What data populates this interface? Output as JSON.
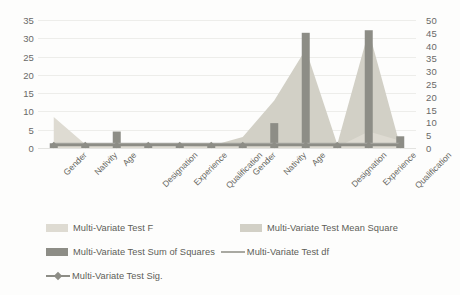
{
  "chart_data": {
    "type": "bar",
    "title": "",
    "subtitle": "",
    "xlabel": "",
    "ylabel": "",
    "ylim": [
      0,
      35
    ],
    "y2lim": [
      0,
      50
    ],
    "grid": true,
    "legend_position": "bottom",
    "categories": [
      "Gender",
      "Nativity",
      "Age",
      "Designation",
      "Experience",
      "Qualification",
      "Gender",
      "Nativity",
      "Age",
      "Designation",
      "Experience",
      "Qualification"
    ],
    "left_axis_ticks": [
      "0",
      "5",
      "10",
      "15",
      "20",
      "25",
      "30",
      "35"
    ],
    "right_axis_ticks": [
      "0",
      "5",
      "10",
      "15",
      "20",
      "25",
      "30",
      "35",
      "40",
      "45",
      "50"
    ],
    "series": [
      {
        "name": "Multi-Variate Test F",
        "type": "area",
        "color": "#dedbd2",
        "axis": "left",
        "values": [
          8.5,
          1.0,
          0.6,
          0.4,
          0.4,
          0.5,
          0.8,
          1.2,
          1.5,
          0.3,
          4.5,
          2.0
        ]
      },
      {
        "name": "Multi-Variate Test Mean Square",
        "type": "area",
        "color": "#d2d0c6",
        "axis": "left",
        "values": [
          1.2,
          0.5,
          0.5,
          0.4,
          0.4,
          0.6,
          3.0,
          13.0,
          27.0,
          1.0,
          32.0,
          0.5
        ]
      },
      {
        "name": "Multi-Variate Test Sum of Squares",
        "type": "bar",
        "color": "#8d8d86",
        "axis": "left",
        "values": [
          1.3,
          0.9,
          4.5,
          0.8,
          0.8,
          0.9,
          1.2,
          6.8,
          31.5,
          0.8,
          32.2,
          3.2
        ]
      },
      {
        "name": "Multi-Variate Test df",
        "type": "line",
        "color": "#a9a9a2",
        "axis": "left",
        "values": [
          1.0,
          1.0,
          1.0,
          1.0,
          1.0,
          1.0,
          1.0,
          1.0,
          1.0,
          1.0,
          1.0,
          1.0
        ]
      },
      {
        "name": "Multi-Variate Test Sig.",
        "type": "line-marker",
        "color": "#8d8d86",
        "axis": "left",
        "values": [
          0.8,
          0.8,
          0.8,
          0.8,
          0.8,
          0.8,
          0.8,
          0.8,
          0.8,
          0.8,
          0.8,
          0.8
        ]
      }
    ]
  },
  "legend": {
    "items": [
      {
        "label": "Multi-Variate Test F",
        "marker": "area-swatch",
        "color": "#dedbd2"
      },
      {
        "label": "Multi-Variate Test Mean Square",
        "marker": "area-swatch",
        "color": "#d2d0c6"
      },
      {
        "label": "Multi-Variate Test Sum of Squares",
        "marker": "bar-swatch",
        "color": "#8d8d86"
      },
      {
        "label": "Multi-Variate Test df",
        "marker": "line",
        "color": "#a9a9a2"
      },
      {
        "label": "Multi-Variate Test Sig.",
        "marker": "line-with-diamond",
        "color": "#8d8d86"
      }
    ]
  },
  "colors": {
    "background": "#fdfdfc",
    "gridline": "#ededea",
    "axis_text": "#6a6a68",
    "label_text": "#67675f"
  }
}
